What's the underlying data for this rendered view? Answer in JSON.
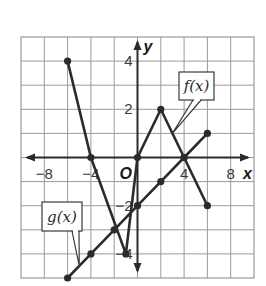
{
  "chart_data": {
    "type": "line",
    "title": "",
    "xlabel": "x",
    "ylabel": "y",
    "xlim": [
      -10,
      10
    ],
    "ylim": [
      -5,
      5
    ],
    "x_grid_step": 2,
    "y_grid_step": 1,
    "grid": true,
    "origin_label": "O",
    "x_tick_labels": [
      {
        "value": -8,
        "label": "−8"
      },
      {
        "value": -4,
        "label": "−4"
      },
      {
        "value": 4,
        "label": "4"
      },
      {
        "value": 8,
        "label": "8"
      }
    ],
    "y_tick_labels": [
      {
        "value": 4,
        "label": "4"
      },
      {
        "value": 2,
        "label": "2"
      },
      {
        "value": -2,
        "label": "−2"
      },
      {
        "value": -4,
        "label": "−4"
      }
    ],
    "series": [
      {
        "name": "f(x)",
        "label": "f(x)",
        "color": "#2b2b2b",
        "points": [
          [
            -6,
            4
          ],
          [
            -4,
            0
          ],
          [
            -1,
            -4
          ],
          [
            0,
            0
          ],
          [
            2,
            2
          ],
          [
            4,
            0
          ],
          [
            6,
            -2
          ]
        ]
      },
      {
        "name": "g(x)",
        "label": "g(x)",
        "color": "#2b2b2b",
        "points": [
          [
            -6,
            -5
          ],
          [
            -4,
            -4
          ],
          [
            -2,
            -3
          ],
          [
            0,
            -2
          ],
          [
            2,
            -1
          ],
          [
            4,
            0
          ],
          [
            6,
            1
          ]
        ]
      }
    ],
    "callouts": [
      {
        "series": "f(x)",
        "text": "f(x)",
        "position": "upper-right",
        "points_to": [
          3,
          1
        ]
      },
      {
        "series": "g(x)",
        "text": "g(x)",
        "position": "lower-left",
        "points_to": [
          -5,
          -4.5
        ]
      }
    ]
  },
  "colors": {
    "grid": "#9a9a9a",
    "axis": "#2b2b2b",
    "line": "#2b2b2b"
  }
}
